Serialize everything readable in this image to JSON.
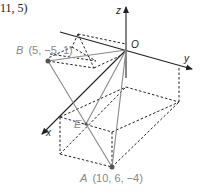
{
  "diagram": {
    "top_partial_label": "11, 5)",
    "axes": {
      "origin_label": "O",
      "x_label": "x",
      "y_label": "y",
      "z_label": "z"
    },
    "points": {
      "A": {
        "name": "A",
        "coords": "(10, 6, −4)"
      },
      "B": {
        "name": "B",
        "coords": "(5, −5, 1)"
      },
      "E": {
        "name": "E"
      }
    },
    "colors": {
      "axis": "#222222",
      "line": "#888888",
      "dashed": "#222222",
      "point": "#555555"
    }
  }
}
